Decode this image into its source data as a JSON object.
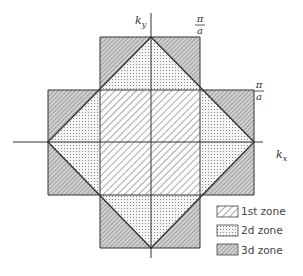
{
  "figure": {
    "axes": {
      "x_label": "k",
      "x_sub": "x",
      "y_label": "k",
      "y_sub": "y"
    },
    "boundary_labels": [
      {
        "id": "top",
        "num": "π",
        "den": "a"
      },
      {
        "id": "right",
        "num": "π",
        "den": "a"
      }
    ],
    "legend": [
      {
        "label": "1st zone",
        "pattern": "diagonal-hatch-light"
      },
      {
        "label": "2d zone",
        "pattern": "dotted"
      },
      {
        "label": "3d zone",
        "pattern": "dense-hatch-gray"
      }
    ],
    "colors": {
      "line": "#333333",
      "zone1_hatch": "#777777",
      "zone2_dots": "#999999",
      "zone3_fill": "#cfcfcf",
      "zone3_hatch": "#666666"
    }
  }
}
